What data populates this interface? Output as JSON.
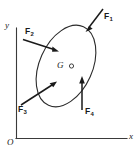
{
  "figure": {
    "type": "free-body-diagram",
    "background_color": "#ffffff",
    "stroke_color": "#1a1a1a"
  },
  "axes": {
    "x_label": "x",
    "y_label": "y",
    "origin_label": "O",
    "x_axis_name": "x-axis",
    "y_axis_name": "y-axis"
  },
  "body": {
    "shape": "ellipse",
    "center_of_gravity_label": "G",
    "cg_marker": "open-circle"
  },
  "forces": [
    {
      "label": "F",
      "subscript": "1",
      "name": "force-f1",
      "direction": "down-left",
      "note": "applied at upper-right of body, pointing into the body"
    },
    {
      "label": "F",
      "subscript": "2",
      "name": "force-f2",
      "direction": "down-right",
      "note": "applied at upper-left of body, pointing into the body"
    },
    {
      "label": "F",
      "subscript": "3",
      "name": "force-f3",
      "direction": "up-right",
      "note": "applied at lower-left of body, pointing into the body"
    },
    {
      "label": "F",
      "subscript": "4",
      "name": "force-f4",
      "direction": "up",
      "note": "applied at lower portion of body, vertical"
    }
  ]
}
